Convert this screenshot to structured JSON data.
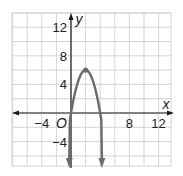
{
  "chart_data": {
    "type": "line",
    "title": "",
    "xlabel": "x",
    "ylabel": "y",
    "origin_label": "O",
    "xlim": [
      -8,
      13
    ],
    "ylim": [
      -7.4,
      14
    ],
    "grid": true,
    "grid_step": 2,
    "x_ticks": [
      {
        "value": -4,
        "label": "−4"
      },
      {
        "value": 8,
        "label": "8"
      },
      {
        "value": 12,
        "label": "12"
      }
    ],
    "y_ticks": [
      {
        "value": 12,
        "label": "12"
      },
      {
        "value": 8,
        "label": "8"
      },
      {
        "value": 4,
        "label": "4"
      },
      {
        "value": -4,
        "label": "−4"
      }
    ],
    "series": [
      {
        "name": "parabola",
        "equation": "y = -1.5x^2 + 6x",
        "vertex": [
          2,
          6
        ],
        "x_intercepts": [
          0,
          4
        ],
        "x": [
          -0.15,
          0,
          0.5,
          1,
          1.5,
          2,
          2.5,
          3,
          3.5,
          4,
          4.15
        ],
        "values": [
          -0.93,
          0,
          2.625,
          4.5,
          5.625,
          6,
          5.625,
          4.5,
          2.625,
          0,
          -0.93
        ],
        "color": "#6b6b6b",
        "arrows": "both ends pointing down"
      }
    ],
    "colors": {
      "grid": "#d4d4d4",
      "axes": "#1a1a1a",
      "curve": "#6b6b6b"
    }
  }
}
